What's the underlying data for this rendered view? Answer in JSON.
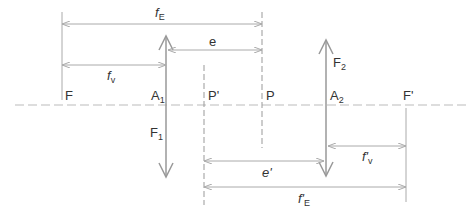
{
  "diagram": {
    "type": "optical-system-two-thin-lenses",
    "colors": {
      "line": "#9a9a9a",
      "axis": "#b8b8b8",
      "text": "#333333"
    },
    "points": {
      "F": {
        "label": "F",
        "x": 62
      },
      "A1": {
        "label": "A",
        "sub": "1",
        "x": 166
      },
      "P_prime": {
        "label": "P'",
        "x": 204
      },
      "P": {
        "label": "P",
        "x": 262
      },
      "A2": {
        "label": "A",
        "sub": "2",
        "x": 326
      },
      "F_prime": {
        "label": "F'",
        "x": 406
      }
    },
    "lenses": {
      "L1": {
        "label": "F",
        "sub": "1",
        "type": "converging"
      },
      "L2": {
        "label": "F",
        "sub": "2",
        "type": "converging"
      }
    },
    "dimensions": {
      "fE": {
        "label": "f",
        "sub": "E"
      },
      "e": {
        "label": "e"
      },
      "fv": {
        "label": "f",
        "sub": "v"
      },
      "e_prime": {
        "label": "e'"
      },
      "fv_prime": {
        "label": "f'",
        "sub": "v"
      },
      "fE_prime": {
        "label": "f'",
        "sub": "E"
      }
    }
  }
}
